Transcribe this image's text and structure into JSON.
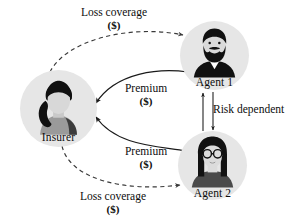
{
  "diagram": {
    "background_color": "#ffffff",
    "node_fill_color": "#e6e6e6",
    "stroke_color": "#1a1a1a",
    "nodes": [
      {
        "id": "insurer",
        "label": "Insurer",
        "icon": "person-ponytail-avatar-icon",
        "center": {
          "x": 58,
          "y": 109
        },
        "radius": 38
      },
      {
        "id": "agent1",
        "label": "Agent 1",
        "icon": "person-beard-avatar-icon",
        "center": {
          "x": 214,
          "y": 56
        },
        "radius": 34
      },
      {
        "id": "agent2",
        "label": "Agent 2",
        "icon": "person-glasses-avatar-icon",
        "center": {
          "x": 212,
          "y": 166
        },
        "radius": 34
      }
    ],
    "edges": [
      {
        "id": "loss-coverage-agent1",
        "from": "insurer",
        "to": "agent1",
        "style": "dashed",
        "arrow": "end",
        "label": "Loss coverage",
        "sublabel": "($)"
      },
      {
        "id": "premium-agent1",
        "from": "agent1",
        "to": "insurer",
        "style": "solid",
        "arrow": "end",
        "label": "Premium",
        "sublabel": "($)"
      },
      {
        "id": "premium-agent2",
        "from": "agent2",
        "to": "insurer",
        "style": "solid",
        "arrow": "end",
        "label": "Premium",
        "sublabel": "($)"
      },
      {
        "id": "loss-coverage-agent2",
        "from": "insurer",
        "to": "agent2",
        "style": "dashed",
        "arrow": "end",
        "label": "Loss coverage",
        "sublabel": "($)"
      },
      {
        "id": "risk-dependent",
        "from": "agent1",
        "to": "agent2",
        "style": "solid",
        "arrow": "both",
        "label": "Risk dependent",
        "sublabel": ""
      }
    ]
  }
}
